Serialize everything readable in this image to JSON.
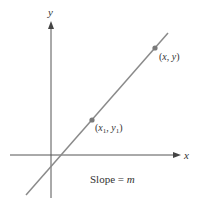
{
  "diagram": {
    "type": "coordinate-plane-line",
    "axes": {
      "x_label": "x",
      "y_label": "y"
    },
    "points": [
      {
        "id": "p1",
        "label_text": "(x1, y1)",
        "label_parts": {
          "open": "(",
          "x": "x",
          "x_sub": "1",
          "sep": ", ",
          "y": "y",
          "y_sub": "1",
          "close": ")"
        }
      },
      {
        "id": "p2",
        "label_text": "(x, y)",
        "label_parts": {
          "open": "(",
          "x": "x",
          "sep": ", ",
          "y": "y",
          "close": ")"
        }
      }
    ],
    "caption": {
      "prefix": "Slope = ",
      "var": "m"
    },
    "colors": {
      "axis": "#555555",
      "line": "#8a8a8a",
      "point": "#7a7a7a",
      "text": "#333333"
    }
  }
}
